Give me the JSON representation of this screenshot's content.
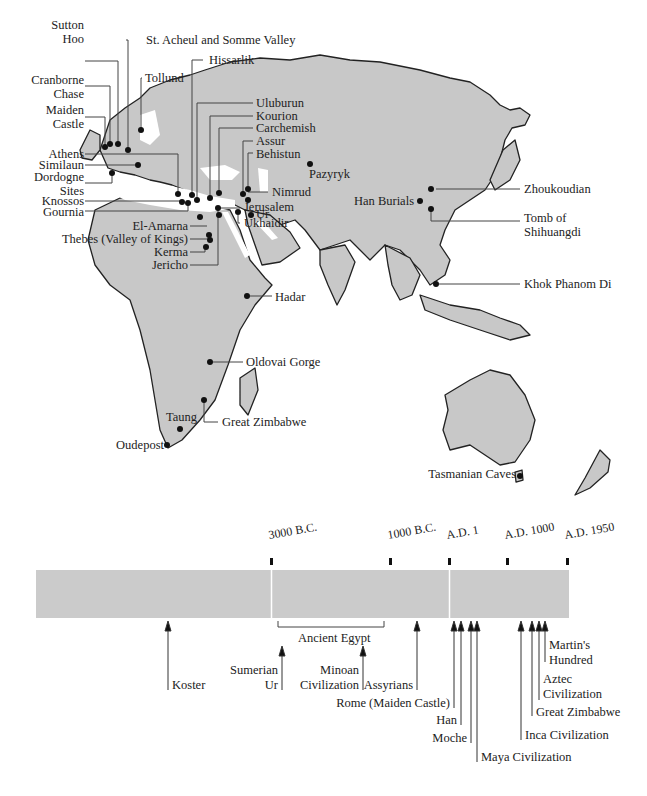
{
  "map": {
    "sites": [
      {
        "id": "sutton-hoo",
        "label": "Sutton\nHoo"
      },
      {
        "id": "st-acheul",
        "label": "St. Acheul and Somme Valley"
      },
      {
        "id": "hissarlik",
        "label": "Hissarlik"
      },
      {
        "id": "cranborne-chase",
        "label": "Cranborne\nChase"
      },
      {
        "id": "tollund",
        "label": "Tollund"
      },
      {
        "id": "maiden-castle",
        "label": "Maiden\nCastle"
      },
      {
        "id": "uluburun",
        "label": "Uluburun"
      },
      {
        "id": "kourion",
        "label": "Kourion"
      },
      {
        "id": "carchemish",
        "label": "Carchemish"
      },
      {
        "id": "assur",
        "label": "Assur"
      },
      {
        "id": "behistun",
        "label": "Behistun"
      },
      {
        "id": "pazyryk",
        "label": "Pazyryk"
      },
      {
        "id": "athens",
        "label": "Athens"
      },
      {
        "id": "similaun",
        "label": "Similaun"
      },
      {
        "id": "dordogne",
        "label": "Dordogne\nSites"
      },
      {
        "id": "knossos",
        "label": "Knossos"
      },
      {
        "id": "gournia",
        "label": "Gournia"
      },
      {
        "id": "nimrud",
        "label": "Nimrud"
      },
      {
        "id": "jerusalem",
        "label": "Jerusalem"
      },
      {
        "id": "ur",
        "label": "Ur"
      },
      {
        "id": "ukhaidir",
        "label": "Ukhaidir"
      },
      {
        "id": "el-amarna",
        "label": "El-Amarna"
      },
      {
        "id": "thebes",
        "label": "Thebes (Valley of Kings)"
      },
      {
        "id": "kerma",
        "label": "Kerma"
      },
      {
        "id": "jericho",
        "label": "Jericho"
      },
      {
        "id": "zhoukoudian",
        "label": "Zhoukoudian"
      },
      {
        "id": "han-burials",
        "label": "Han Burials"
      },
      {
        "id": "tomb-shihuangdi",
        "label": "Tomb of\nShihuangdi"
      },
      {
        "id": "khok-phanom-di",
        "label": "Khok Phanom Di"
      },
      {
        "id": "hadar",
        "label": "Hadar"
      },
      {
        "id": "oldovai",
        "label": "Oldovai Gorge"
      },
      {
        "id": "great-zimbabwe",
        "label": "Great Zimbabwe"
      },
      {
        "id": "taung",
        "label": "Taung"
      },
      {
        "id": "oudepost",
        "label": "Oudepost"
      },
      {
        "id": "tasmanian-caves",
        "label": "Tasmanian Caves"
      }
    ],
    "colors": {
      "land": "#c8c8c8",
      "coast": "#222222",
      "dot": "#111111"
    }
  },
  "timeline": {
    "ticks": [
      "3000 B.C.",
      "1000 B.C.",
      "A.D. 1",
      "A.D. 1000",
      "A.D. 1950"
    ],
    "events": [
      {
        "label": "Koster"
      },
      {
        "label": "Ancient Egypt"
      },
      {
        "label": "Sumerian\nUr"
      },
      {
        "label": "Minoan\nCivilization"
      },
      {
        "label": "Assyrians"
      },
      {
        "label": "Rome (Maiden Castle)"
      },
      {
        "label": "Han"
      },
      {
        "label": "Moche"
      },
      {
        "label": "Maya Civilization"
      },
      {
        "label": "Inca Civilization"
      },
      {
        "label": "Great Zimbabwe"
      },
      {
        "label": "Aztec\nCivilization"
      },
      {
        "label": "Martin's\nHundred"
      }
    ],
    "colors": {
      "bar": "#cbcbcb",
      "divider": "#ffffff"
    }
  }
}
